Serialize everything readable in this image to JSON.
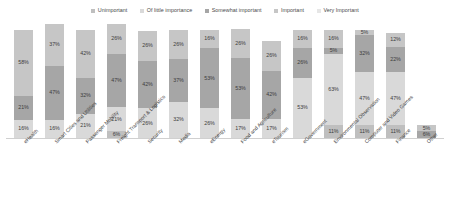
{
  "chart_data": {
    "type": "bar",
    "subtype": "stacked-bar-100-percent",
    "title": "",
    "xlabel": "",
    "ylabel": "",
    "ylim": [
      0,
      100
    ],
    "grid": false,
    "legend_position": "top-center",
    "value_suffix": "%",
    "categories": [
      "eHealth",
      "Smart Cities and Utilities",
      "Passenger Mobility",
      "Freight Transport & Logistics",
      "Security",
      "Media",
      "eEnergy",
      "Food and Agriculture",
      "eTourism",
      "eGovernment",
      "Environmental Observation",
      "Computer and Video Games",
      "Finance",
      "Other"
    ],
    "series": [
      {
        "name": "Unimportant",
        "color": "#bfbfbf",
        "values": [
          null,
          null,
          null,
          6,
          null,
          null,
          null,
          null,
          null,
          null,
          11,
          11,
          11,
          null
        ]
      },
      {
        "name": "Of little importance",
        "color": "#d9d9d9",
        "values": [
          16,
          16,
          21,
          21,
          26,
          32,
          26,
          17,
          17,
          53,
          63,
          47,
          47,
          6
        ]
      },
      {
        "name": "Somewhat important",
        "color": "#a6a6a6",
        "values": [
          21,
          47,
          32,
          47,
          42,
          37,
          53,
          53,
          42,
          26,
          32,
          32,
          22,
          5
        ]
      },
      {
        "name": "Important",
        "color": "#cccccc",
        "values": [
          58,
          37,
          42,
          26,
          26,
          26,
          16,
          26,
          26,
          16,
          5,
          5,
          12,
          null
        ]
      },
      {
        "name": "Very Important",
        "color": "#e6e6e6",
        "values": [
          null,
          null,
          null,
          null,
          null,
          null,
          null,
          null,
          null,
          null,
          null,
          null,
          null,
          null
        ]
      }
    ],
    "bars": [
      {
        "category": "eHealth",
        "segments": [
          {
            "series": "Of little importance",
            "value": 16,
            "label": "16%",
            "color": "#d9d9d9"
          },
          {
            "series": "Somewhat important",
            "value": 21,
            "label": "21%",
            "color": "#a6a6a6"
          },
          {
            "series": "Important",
            "value": 58,
            "label": "58%",
            "color": "#c6c6c6"
          }
        ]
      },
      {
        "category": "Smart Cities and Utilities",
        "segments": [
          {
            "series": "Of little importance",
            "value": 16,
            "label": "16%",
            "color": "#d9d9d9"
          },
          {
            "series": "Somewhat important",
            "value": 47,
            "label": "47%",
            "color": "#a6a6a6"
          },
          {
            "series": "Important",
            "value": 37,
            "label": "37%",
            "color": "#c6c6c6"
          }
        ]
      },
      {
        "category": "Passenger Mobility",
        "segments": [
          {
            "series": "Of little importance",
            "value": 21,
            "label": "21%",
            "color": "#d9d9d9"
          },
          {
            "series": "Somewhat important",
            "value": 32,
            "label": "32%",
            "color": "#a6a6a6"
          },
          {
            "series": "Important",
            "value": 42,
            "label": "42%",
            "color": "#c6c6c6"
          }
        ]
      },
      {
        "category": "Freight Transport & Logistics",
        "segments": [
          {
            "series": "Unimportant",
            "value": 6,
            "label": "6%",
            "color": "#bfbfbf"
          },
          {
            "series": "Of little importance",
            "value": 21,
            "label": "21%",
            "color": "#d9d9d9"
          },
          {
            "series": "Somewhat important",
            "value": 47,
            "label": "47%",
            "color": "#a6a6a6"
          },
          {
            "series": "Important",
            "value": 26,
            "label": "26%",
            "color": "#c6c6c6"
          }
        ]
      },
      {
        "category": "Security",
        "segments": [
          {
            "series": "Of little importance",
            "value": 26,
            "label": "26%",
            "color": "#d9d9d9"
          },
          {
            "series": "Somewhat important",
            "value": 42,
            "label": "42%",
            "color": "#a6a6a6"
          },
          {
            "series": "Important",
            "value": 26,
            "label": "26%",
            "color": "#c6c6c6"
          }
        ]
      },
      {
        "category": "Media",
        "segments": [
          {
            "series": "Of little importance",
            "value": 32,
            "label": "32%",
            "color": "#d9d9d9"
          },
          {
            "series": "Somewhat important",
            "value": 37,
            "label": "37%",
            "color": "#a6a6a6"
          },
          {
            "series": "Important",
            "value": 26,
            "label": "26%",
            "color": "#c6c6c6"
          }
        ]
      },
      {
        "category": "eEnergy",
        "segments": [
          {
            "series": "Of little importance",
            "value": 26,
            "label": "26%",
            "color": "#d9d9d9"
          },
          {
            "series": "Somewhat important",
            "value": 53,
            "label": "53%",
            "color": "#a6a6a6"
          },
          {
            "series": "Important",
            "value": 16,
            "label": "16%",
            "color": "#c6c6c6"
          }
        ]
      },
      {
        "category": "Food and Agriculture",
        "segments": [
          {
            "series": "Of little importance",
            "value": 17,
            "label": "17%",
            "color": "#d9d9d9"
          },
          {
            "series": "Somewhat important",
            "value": 53,
            "label": "53%",
            "color": "#a6a6a6"
          },
          {
            "series": "Important",
            "value": 26,
            "label": "26%",
            "color": "#c6c6c6"
          }
        ]
      },
      {
        "category": "eTourism",
        "segments": [
          {
            "series": "Of little importance",
            "value": 17,
            "label": "17%",
            "color": "#d9d9d9"
          },
          {
            "series": "Somewhat important",
            "value": 42,
            "label": "42%",
            "color": "#a6a6a6"
          },
          {
            "series": "Important",
            "value": 26,
            "label": "26%",
            "color": "#c6c6c6"
          }
        ]
      },
      {
        "category": "eGovernment",
        "segments": [
          {
            "series": "Of little importance",
            "value": 53,
            "label": "53%",
            "color": "#d9d9d9"
          },
          {
            "series": "Somewhat important",
            "value": 26,
            "label": "26%",
            "color": "#a6a6a6"
          },
          {
            "series": "Important",
            "value": 16,
            "label": "16%",
            "color": "#c6c6c6"
          }
        ]
      },
      {
        "category": "Environmental Observation",
        "segments": [
          {
            "series": "Unimportant",
            "value": 11,
            "label": "11%",
            "color": "#bfbfbf"
          },
          {
            "series": "Of little importance",
            "value": 63,
            "label": "63%",
            "color": "#d9d9d9"
          },
          {
            "series": "Somewhat important",
            "value": 5,
            "label": "5%",
            "color": "#a6a6a6"
          },
          {
            "series": "Important",
            "value": 16,
            "label": "16%",
            "color": "#c6c6c6"
          }
        ]
      },
      {
        "category": "Computer and Video Games",
        "segments": [
          {
            "series": "Unimportant",
            "value": 11,
            "label": "11%",
            "color": "#bfbfbf"
          },
          {
            "series": "Of little importance",
            "value": 47,
            "label": "47%",
            "color": "#d9d9d9"
          },
          {
            "series": "Somewhat important",
            "value": 32,
            "label": "32%",
            "color": "#a6a6a6"
          },
          {
            "series": "Important",
            "value": 5,
            "label": "5%",
            "color": "#c6c6c6"
          }
        ]
      },
      {
        "category": "Finance",
        "segments": [
          {
            "series": "Unimportant",
            "value": 11,
            "label": "11%",
            "color": "#bfbfbf"
          },
          {
            "series": "Of little importance",
            "value": 47,
            "label": "47%",
            "color": "#d9d9d9"
          },
          {
            "series": "Somewhat important",
            "value": 22,
            "label": "22%",
            "color": "#a6a6a6"
          },
          {
            "series": "Important",
            "value": 12,
            "label": "12%",
            "color": "#c6c6c6"
          }
        ]
      },
      {
        "category": "Other",
        "segments": [
          {
            "series": "Somewhat important",
            "value": 6,
            "label": "6%",
            "color": "#a6a6a6"
          },
          {
            "series": "Important",
            "value": 5,
            "label": "5%",
            "color": "#c6c6c6"
          }
        ]
      }
    ],
    "legend": [
      {
        "label": "Unimportant",
        "color": "#bfbfbf"
      },
      {
        "label": "Of little importance",
        "color": "#d9d9d9"
      },
      {
        "label": "Somewhat important",
        "color": "#a6a6a6"
      },
      {
        "label": "Important",
        "color": "#c6c6c6"
      },
      {
        "label": "Very Important",
        "color": "#e6e6e6"
      }
    ]
  }
}
